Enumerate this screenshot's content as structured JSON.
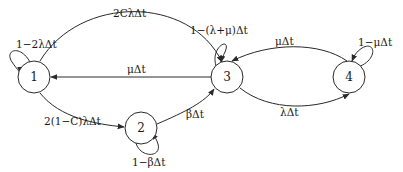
{
  "diagram": {
    "type": "state-transition (Markov chain)",
    "nodes": [
      {
        "id": "1",
        "label": "1"
      },
      {
        "id": "2",
        "label": "2"
      },
      {
        "id": "3",
        "label": "3"
      },
      {
        "id": "4",
        "label": "4"
      }
    ],
    "edges": [
      {
        "from": "1",
        "to": "1",
        "label": "1−2λΔt"
      },
      {
        "from": "1",
        "to": "3",
        "label": "2CλΔt"
      },
      {
        "from": "3",
        "to": "1",
        "label": "μΔt"
      },
      {
        "from": "1",
        "to": "2",
        "label": "2(1−C)λΔt"
      },
      {
        "from": "2",
        "to": "2",
        "label": "1−βΔt"
      },
      {
        "from": "2",
        "to": "3",
        "label": "βΔt"
      },
      {
        "from": "3",
        "to": "3",
        "label": "1−(λ+μ)Δt"
      },
      {
        "from": "4",
        "to": "3",
        "label": "μΔt"
      },
      {
        "from": "3",
        "to": "4",
        "label": "λΔt"
      },
      {
        "from": "4",
        "to": "4",
        "label": "1−μΔt"
      }
    ]
  }
}
